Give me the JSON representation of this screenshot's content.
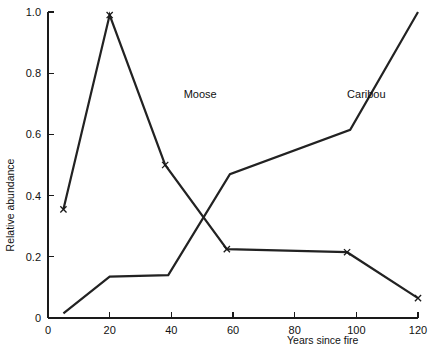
{
  "chart_data": {
    "type": "line",
    "title": "",
    "subtitle": "",
    "xlabel": "Years since fire",
    "ylabel": "Relative abundance",
    "xlim": [
      0,
      120
    ],
    "ylim": [
      0,
      1.0
    ],
    "grid": false,
    "legend_position": "inline-annotation",
    "x_ticks": [
      {
        "value": 0,
        "label": "0"
      },
      {
        "value": 20,
        "label": "20"
      },
      {
        "value": 40,
        "label": "40"
      },
      {
        "value": 60,
        "label": "60"
      },
      {
        "value": 80,
        "label": "80"
      },
      {
        "value": 100,
        "label": "100"
      },
      {
        "value": 120,
        "label": "120"
      }
    ],
    "y_ticks": [
      {
        "value": 0,
        "label": "0"
      },
      {
        "value": 0.2,
        "label": "0.2"
      },
      {
        "value": 0.4,
        "label": "0.4"
      },
      {
        "value": 0.6,
        "label": "0.6"
      },
      {
        "value": 0.8,
        "label": "0.8"
      },
      {
        "value": 1.0,
        "label": "1.0"
      }
    ],
    "marker_symbol": "x",
    "series": [
      {
        "name": "Moose",
        "label": "Moose",
        "label_x": 44,
        "label_y": 0.72,
        "markers": true,
        "color": "#222222",
        "x": [
          5,
          20,
          38,
          58,
          97,
          120
        ],
        "y": [
          0.355,
          0.99,
          0.5,
          0.225,
          0.215,
          0.065
        ]
      },
      {
        "name": "Caribou",
        "label": "Caribou",
        "label_x": 97,
        "label_y": 0.72,
        "markers": false,
        "color": "#222222",
        "x": [
          5,
          20,
          39,
          59,
          98,
          120
        ],
        "y": [
          0.015,
          0.135,
          0.14,
          0.47,
          0.615,
          1.0
        ]
      }
    ],
    "annotations": [
      {
        "text": "Moose",
        "x": 44,
        "y": 0.72
      },
      {
        "text": "Caribou",
        "x": 97,
        "y": 0.72
      }
    ]
  }
}
